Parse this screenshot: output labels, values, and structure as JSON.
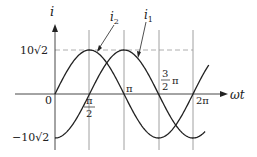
{
  "diagram": {
    "y_axis_label": "i",
    "x_axis_label": "ωt",
    "origin_label": "0",
    "y_max_label": "10√2",
    "y_min_label": "−10√2",
    "x_ticks": [
      {
        "label": "π/2",
        "num": "π",
        "den": "2"
      },
      {
        "label": "π",
        "num": "π"
      },
      {
        "label": "3/2 π",
        "num": "3",
        "den": "2",
        "suffix": "π"
      },
      {
        "label": "2π",
        "num": "2π"
      }
    ],
    "curves": [
      {
        "name": "i₂",
        "label": "i",
        "sub": "2",
        "expr": "10√2 sin(ωt)"
      },
      {
        "name": "i₁",
        "label": "i",
        "sub": "1",
        "expr": "10√2 sin(ωt − π/2)"
      }
    ],
    "colors": {
      "curve": "#222222",
      "grid": "#888888",
      "dash": "#999999",
      "axis": "#333333"
    }
  }
}
